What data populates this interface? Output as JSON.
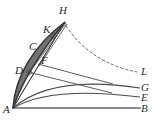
{
  "figure": {
    "width": 157,
    "height": 126,
    "background_color": "#ffffff",
    "stroke_color": "#3a3a3a",
    "baseline_color": "#8c8c8c",
    "dashed_color": "#6e6e6e"
  },
  "labels": {
    "A": "A",
    "B": "B",
    "C": "C",
    "D": "D",
    "E": "E",
    "F": "F",
    "G": "G",
    "H": "H",
    "K": "K",
    "L": "L"
  },
  "points": {
    "A": {
      "label": "A",
      "x": 13,
      "y": 108,
      "label_x": 4,
      "label_y": 107
    },
    "B": {
      "label": "B",
      "x": 140,
      "y": 108,
      "label_x": 142,
      "label_y": 106
    },
    "C": {
      "label": "C",
      "x": 36,
      "y": 48,
      "label_x": 30,
      "label_y": 44
    },
    "D": {
      "label": "D",
      "x": 27,
      "y": 72,
      "label_x": 16,
      "label_y": 68
    },
    "E": {
      "label": "E",
      "x": 140,
      "y": 97,
      "label_x": 142,
      "label_y": 95
    },
    "F": {
      "label": "F",
      "x": 39,
      "y": 65,
      "label_x": 42,
      "label_y": 58
    },
    "G": {
      "label": "G",
      "x": 140,
      "y": 88,
      "label_x": 142,
      "label_y": 86
    },
    "H": {
      "label": "H",
      "x": 65,
      "y": 22,
      "label_x": 60,
      "label_y": 8
    },
    "K": {
      "label": "K",
      "x": 52,
      "y": 35,
      "label_x": 44,
      "label_y": 27
    },
    "L": {
      "label": "L",
      "x": 138,
      "y": 72,
      "label_x": 142,
      "label_y": 70
    }
  },
  "curves": {
    "baseline_AB": {
      "name": "baseline-AB",
      "style": "solid-thick-gray",
      "path": "M 13 108 L 140 108"
    },
    "arc_AE": {
      "name": "arc-AE",
      "style": "solid",
      "path": "M 13 108 C 40 92 85 90 140 97"
    },
    "arc_AG": {
      "name": "arc-AG",
      "style": "solid",
      "path": "M 13 108 C 42 83 88 80 140 88"
    },
    "arc_AH_outer": {
      "name": "arc-AH-outer",
      "style": "solid",
      "path": "M 13 108 C 16 78 36 44 65 22"
    },
    "arc_AH_inner": {
      "name": "arc-AH-inner",
      "style": "solid",
      "path": "M 13 108 C 22 80 42 48 65 22"
    },
    "chord_AH": {
      "name": "chord-AH",
      "style": "solid",
      "path": "M 13 108 L 65 22"
    },
    "segment_DF": {
      "name": "segment-DF",
      "style": "solid",
      "path": "M 27 72 L 108 92"
    },
    "segment_FK": {
      "name": "segment-FK",
      "style": "solid",
      "path": "M 39 65 L 110 83"
    },
    "segment_K_ray": {
      "name": "segment-K-ray",
      "style": "solid",
      "path": "M 52 35 L 66 24"
    },
    "dashed_HL": {
      "name": "dashed-curve-HL",
      "style": "dashed",
      "path": "M 66 25 C 80 48 105 66 138 72"
    }
  },
  "right_angle_marks": [
    {
      "name": "right-angle-mark-D",
      "x": 29,
      "y": 72
    },
    {
      "name": "right-angle-mark-K",
      "x": 54,
      "y": 36
    }
  ]
}
